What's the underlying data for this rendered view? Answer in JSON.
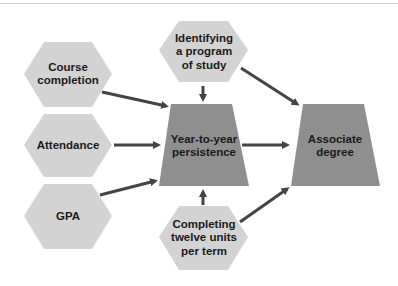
{
  "diagram": {
    "colors": {
      "hexagon_fill": "#d3d3d3",
      "outcome_fill": "#8f8f8f",
      "arrow": "#444444",
      "text": "#1a1a1a",
      "top_rule": "#c8c8c8"
    },
    "nodes": {
      "course_completion": {
        "label": "Course completion",
        "shape": "hexagon"
      },
      "attendance": {
        "label": "Attendance",
        "shape": "hexagon"
      },
      "gpa": {
        "label": "GPA",
        "shape": "hexagon"
      },
      "identifying_program": {
        "label": "Identifying a program of study",
        "shape": "hexagon"
      },
      "completing_units": {
        "label": "Completing twelve units per term",
        "shape": "hexagon"
      },
      "persistence": {
        "label": "Year-to-year persistence",
        "shape": "trapezoid"
      },
      "associate_degree": {
        "label": "Associate degree",
        "shape": "trapezoid"
      }
    },
    "edges": [
      {
        "from": "Course completion",
        "to": "Year-to-year persistence"
      },
      {
        "from": "Attendance",
        "to": "Year-to-year persistence"
      },
      {
        "from": "GPA",
        "to": "Year-to-year persistence"
      },
      {
        "from": "Identifying a program of study",
        "to": "Year-to-year persistence"
      },
      {
        "from": "Identifying a program of study",
        "to": "Associate degree"
      },
      {
        "from": "Completing twelve units per term",
        "to": "Year-to-year persistence"
      },
      {
        "from": "Completing twelve units per term",
        "to": "Associate degree"
      },
      {
        "from": "Year-to-year persistence",
        "to": "Associate degree"
      }
    ]
  }
}
